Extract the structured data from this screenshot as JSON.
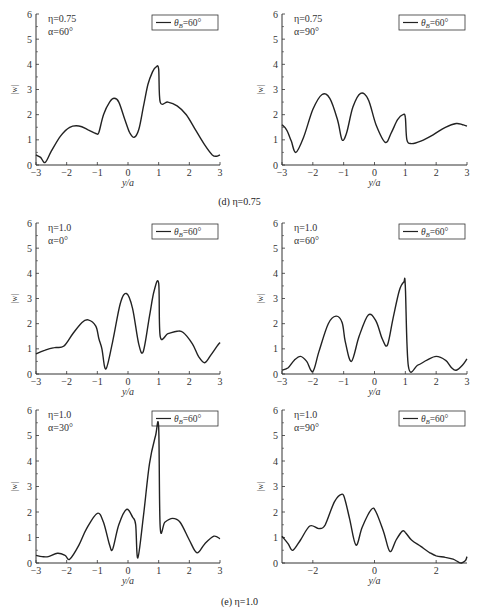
{
  "captions": {
    "d": "(d) η=0.75",
    "e": "(e) η=1.0"
  },
  "common": {
    "ylabel": "|w|",
    "xlabel": "y/a",
    "legend": "θ_B=60°",
    "yticks": [
      0,
      1,
      2,
      3,
      4,
      5,
      6
    ]
  },
  "chart_data": [
    {
      "type": "line",
      "title": "η=0.75, α=60°",
      "eta": "η=0.75",
      "alpha": "α=60°",
      "xlabel": "y/a",
      "ylabel": "|w|",
      "xlim": [
        -3,
        3
      ],
      "ylim": [
        0,
        6
      ],
      "xticks": [
        -3,
        -2,
        -1,
        0,
        1,
        2,
        3
      ],
      "legend": [
        "θB=60°"
      ],
      "series": [
        {
          "name": "θB=60°",
          "x": [
            -3,
            -2.85,
            -2.7,
            -2.5,
            -2.2,
            -1.9,
            -1.6,
            -1.3,
            -1.05,
            -0.95,
            -0.8,
            -0.6,
            -0.45,
            -0.3,
            -0.1,
            0.05,
            0.2,
            0.35,
            0.5,
            0.65,
            0.8,
            0.92,
            1.0,
            1.05,
            1.3,
            1.6,
            1.9,
            2.2,
            2.5,
            2.75,
            2.9,
            3
          ],
          "y": [
            0.4,
            0.3,
            0.1,
            0.55,
            1.15,
            1.5,
            1.55,
            1.4,
            1.25,
            1.3,
            2.0,
            2.5,
            2.65,
            2.5,
            1.8,
            1.3,
            1.1,
            1.4,
            2.3,
            3.2,
            3.7,
            3.9,
            3.8,
            2.5,
            2.5,
            2.35,
            2.0,
            1.4,
            0.8,
            0.4,
            0.35,
            0.4
          ]
        }
      ]
    },
    {
      "type": "line",
      "title": "η=0.75, α=90°",
      "eta": "η=0.75",
      "alpha": "α=90°",
      "xlabel": "y/a",
      "ylabel": "|w|",
      "xlim": [
        -3,
        3
      ],
      "ylim": [
        0,
        6
      ],
      "xticks": [
        -3,
        -2,
        -1,
        0,
        1,
        2,
        3
      ],
      "legend": [
        "θB=60°"
      ],
      "series": [
        {
          "name": "θB=60°",
          "x": [
            -3,
            -2.85,
            -2.7,
            -2.55,
            -2.3,
            -2.0,
            -1.7,
            -1.45,
            -1.2,
            -1.05,
            -0.9,
            -0.7,
            -0.45,
            -0.2,
            0.05,
            0.35,
            0.55,
            0.75,
            0.92,
            1.0,
            1.05,
            1.2,
            1.5,
            1.9,
            2.3,
            2.65,
            2.85,
            3
          ],
          "y": [
            1.6,
            1.4,
            0.95,
            0.5,
            1.1,
            2.2,
            2.8,
            2.65,
            1.8,
            1.0,
            1.3,
            2.3,
            2.85,
            2.6,
            1.6,
            0.9,
            1.3,
            1.8,
            2.0,
            1.9,
            1.0,
            0.85,
            0.95,
            1.2,
            1.5,
            1.65,
            1.6,
            1.55
          ]
        }
      ]
    },
    {
      "type": "line",
      "title": "η=1.0, α=0°",
      "eta": "η=1.0",
      "alpha": "α=0°",
      "xlabel": "y/a",
      "ylabel": "|w|",
      "xlim": [
        -3,
        3
      ],
      "ylim": [
        0,
        6
      ],
      "xticks": [
        -3,
        -2,
        -1,
        0,
        1,
        2,
        3
      ],
      "legend": [
        "θB=60°"
      ],
      "series": [
        {
          "name": "θB=60°",
          "x": [
            -3,
            -2.7,
            -2.4,
            -2.1,
            -1.8,
            -1.5,
            -1.3,
            -1.05,
            -0.95,
            -0.85,
            -0.72,
            -0.5,
            -0.25,
            -0.05,
            0.15,
            0.35,
            0.5,
            0.7,
            0.85,
            1.0,
            1.05,
            1.3,
            1.6,
            1.8,
            2.1,
            2.3,
            2.5,
            2.7,
            2.9,
            3
          ],
          "y": [
            0.8,
            0.95,
            1.05,
            1.1,
            1.6,
            2.05,
            2.15,
            1.9,
            1.4,
            1.0,
            0.2,
            1.3,
            2.8,
            3.2,
            2.6,
            1.2,
            0.9,
            2.3,
            3.3,
            3.6,
            1.5,
            1.6,
            1.7,
            1.65,
            1.2,
            0.7,
            0.45,
            0.75,
            1.1,
            1.25
          ]
        }
      ]
    },
    {
      "type": "line",
      "title": "η=1.0, α=60°",
      "eta": "η=1.0",
      "alpha": "α=60°",
      "xlabel": "y/a",
      "ylabel": "|w|",
      "xlim": [
        -3,
        3
      ],
      "ylim": [
        0,
        6
      ],
      "xticks": [
        -3,
        -2,
        -1,
        0,
        1,
        2,
        3
      ],
      "legend": [
        "θB=60°"
      ],
      "series": [
        {
          "name": "θB=60°",
          "x": [
            -3,
            -2.8,
            -2.6,
            -2.4,
            -2.2,
            -2.0,
            -1.8,
            -1.5,
            -1.25,
            -1.05,
            -0.95,
            -0.75,
            -0.5,
            -0.2,
            0.05,
            0.25,
            0.42,
            0.6,
            0.8,
            0.95,
            1.0,
            1.1,
            1.4,
            1.7,
            2.0,
            2.3,
            2.5,
            2.65,
            2.85,
            3
          ],
          "y": [
            0.15,
            0.25,
            0.55,
            0.7,
            0.5,
            0.1,
            0.9,
            2.0,
            2.3,
            2.05,
            1.3,
            0.5,
            1.5,
            2.35,
            2.1,
            1.4,
            1.15,
            2.2,
            3.3,
            3.65,
            3.5,
            0.3,
            0.35,
            0.55,
            0.7,
            0.55,
            0.25,
            0.15,
            0.35,
            0.6
          ]
        }
      ]
    },
    {
      "type": "line",
      "title": "η=1.0, α=30°",
      "eta": "η=1.0",
      "alpha": "α=30°",
      "xlabel": "y/a",
      "ylabel": "|w|",
      "xlim": [
        -3,
        3
      ],
      "ylim": [
        0,
        6
      ],
      "xticks": [
        -3,
        -2,
        -1,
        0,
        1,
        2,
        3
      ],
      "legend": [
        "θB=60°"
      ],
      "series": [
        {
          "name": "θB=60°",
          "x": [
            -3,
            -2.8,
            -2.6,
            -2.3,
            -2.05,
            -1.9,
            -1.6,
            -1.35,
            -1.0,
            -0.8,
            -0.6,
            -0.5,
            -0.3,
            -0.05,
            0.15,
            0.25,
            0.32,
            0.5,
            0.7,
            0.9,
            1.0,
            1.05,
            1.2,
            1.45,
            1.7,
            2.0,
            2.25,
            2.5,
            2.8,
            3
          ],
          "y": [
            0.3,
            0.25,
            0.25,
            0.38,
            0.3,
            0.15,
            0.7,
            1.35,
            1.95,
            1.6,
            0.7,
            0.55,
            1.5,
            2.1,
            1.8,
            1.5,
            0.2,
            1.8,
            3.9,
            5.0,
            5.3,
            1.4,
            1.6,
            1.75,
            1.6,
            0.9,
            0.4,
            0.75,
            1.05,
            0.95
          ]
        }
      ]
    },
    {
      "type": "line",
      "title": "η=1.0, α=90°",
      "eta": "η=1.0",
      "alpha": "α=90°",
      "xlabel": "y/a",
      "ylabel": "|w|",
      "xlim": [
        -3,
        3
      ],
      "ylim": [
        0,
        6
      ],
      "xticks": [
        -2,
        0,
        2
      ],
      "legend": [
        "θB=60°"
      ],
      "series": [
        {
          "name": "θB=60°",
          "x": [
            -3,
            -2.8,
            -2.65,
            -2.4,
            -2.1,
            -1.8,
            -1.6,
            -1.3,
            -1.05,
            -0.95,
            -0.8,
            -0.6,
            -0.4,
            -0.1,
            0.05,
            0.3,
            0.5,
            0.7,
            0.9,
            1.0,
            1.2,
            1.5,
            1.8,
            2.0,
            2.3,
            2.55,
            2.7,
            2.82,
            2.95,
            3
          ],
          "y": [
            1.05,
            0.75,
            0.5,
            0.9,
            1.45,
            1.35,
            1.5,
            2.4,
            2.7,
            2.45,
            1.7,
            0.7,
            1.4,
            2.1,
            2.0,
            1.2,
            0.45,
            0.9,
            1.25,
            1.2,
            0.9,
            0.65,
            0.4,
            0.28,
            0.22,
            0.15,
            0.05,
            0.0,
            0.1,
            0.25
          ]
        }
      ]
    }
  ]
}
